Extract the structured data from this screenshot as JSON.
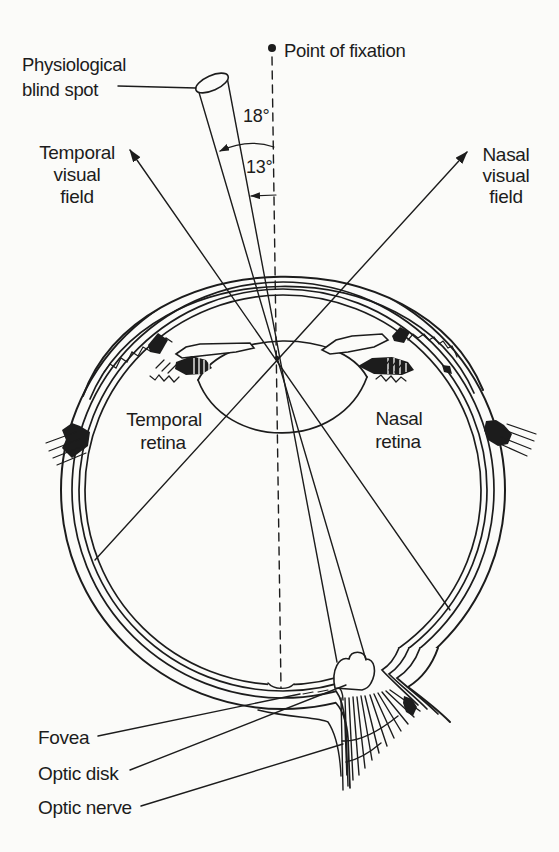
{
  "figure": {
    "colors": {
      "ink": "#1c1c1c",
      "paper": "#fbfbf9"
    },
    "labels": {
      "physiological_blind_spot": [
        "Physiological",
        "blind spot"
      ],
      "point_of_fixation": "Point of fixation",
      "temporal_visual_field": [
        "Temporal",
        "visual",
        "field"
      ],
      "nasal_visual_field": [
        "Nasal",
        "visual",
        "field"
      ],
      "temporal_retina": [
        "Temporal",
        "retina"
      ],
      "nasal_retina": [
        "Nasal",
        "retina"
      ],
      "fovea": "Fovea",
      "optic_disk": "Optic disk",
      "optic_nerve": "Optic nerve"
    },
    "angles": {
      "blind_spot_outer": "18°",
      "blind_spot_inner": "13°"
    }
  }
}
